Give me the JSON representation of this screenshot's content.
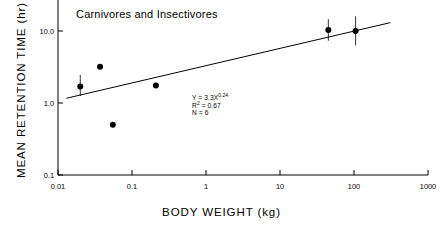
{
  "chart_data": {
    "type": "scatter",
    "title": "Carnivores  and  Insectivores",
    "xlabel": "BODY  WEIGHT  (kg)",
    "ylabel": "MEAN  RETENTION  TIME  (hr)",
    "xscale": "log",
    "yscale": "log",
    "xlim": [
      0.01,
      1000
    ],
    "ylim": [
      0.1,
      100
    ],
    "grid": false,
    "legend": null,
    "xticks": [
      {
        "value": 0.01,
        "label": "0.01"
      },
      {
        "value": 0.1,
        "label": "0.1"
      },
      {
        "value": 1,
        "label": "1"
      },
      {
        "value": 10,
        "label": "10"
      },
      {
        "value": 100,
        "label": "100"
      },
      {
        "value": 1000,
        "label": "1000"
      }
    ],
    "yticks": [
      {
        "value": 0.1,
        "label": "0.1"
      },
      {
        "value": 1.0,
        "label": "1.0"
      },
      {
        "value": 10.0,
        "label": "10.0"
      }
    ],
    "points": [
      {
        "x": 0.02,
        "y": 1.7,
        "yerr_low": 1.25,
        "yerr_high": 2.45
      },
      {
        "x": 0.037,
        "y": 3.2,
        "yerr_low": null,
        "yerr_high": null
      },
      {
        "x": 0.055,
        "y": 0.5,
        "yerr_low": null,
        "yerr_high": null
      },
      {
        "x": 0.21,
        "y": 1.75,
        "yerr_low": null,
        "yerr_high": null
      },
      {
        "x": 45.0,
        "y": 10.3,
        "yerr_low": 7.3,
        "yerr_high": 14.6
      },
      {
        "x": 105.0,
        "y": 10.0,
        "yerr_low": 6.3,
        "yerr_high": 16.0
      }
    ],
    "fit": {
      "equation_y": "Y = 3.3X",
      "equation_exponent": "0.24",
      "r_squared_label": "R",
      "r_squared_sup": "2",
      "r_squared_value": " = 0.67",
      "n_label": "N = 6",
      "coefficient": 3.3,
      "exponent": 0.24,
      "r_squared": 0.67,
      "n": 6,
      "x_start": 0.013,
      "x_end": 310
    },
    "marker_color": "#000000",
    "line_color": "#000000",
    "axis_color": "#000000"
  }
}
